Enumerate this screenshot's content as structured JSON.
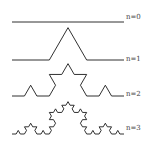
{
  "levels": [
    {
      "n": 0,
      "label": "n=0",
      "baseline_y": 22,
      "label_y": 13
    },
    {
      "n": 1,
      "label": "n=1",
      "baseline_y": 60,
      "label_y": 58
    },
    {
      "n": 2,
      "label": "n=2",
      "baseline_y": 96,
      "label_y": 92
    },
    {
      "n": 3,
      "label": "n=3",
      "baseline_y": 134,
      "label_y": 126
    }
  ],
  "x_start": 12,
  "x_end": 124,
  "stroke_color": "#1a1a1a"
}
